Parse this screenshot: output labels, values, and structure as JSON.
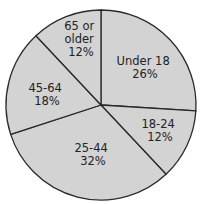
{
  "chart_data": {
    "type": "pie",
    "title": "",
    "categories": [
      "Under 18",
      "18-24",
      "25-44",
      "45-64",
      "65 or older"
    ],
    "values": [
      26,
      12,
      32,
      18,
      12
    ],
    "unit": "%",
    "start_angle_deg": 0,
    "direction": "clockwise",
    "legend": "none (labels inside slices)",
    "colors": {
      "fill": "#d3d3d3",
      "stroke": "#2a2a2a",
      "text": "#222222"
    },
    "labels": [
      {
        "lines": [
          "Under 18",
          "26%"
        ]
      },
      {
        "lines": [
          "18-24",
          "12%"
        ]
      },
      {
        "lines": [
          "25-44",
          "32%"
        ]
      },
      {
        "lines": [
          "45-64",
          "18%"
        ]
      },
      {
        "lines": [
          "65 or",
          "older",
          "12%"
        ]
      }
    ]
  }
}
